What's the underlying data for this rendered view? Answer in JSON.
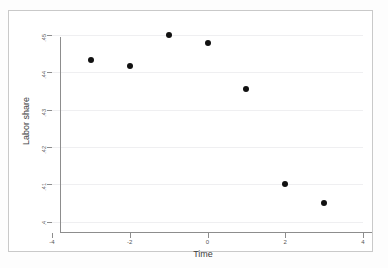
{
  "chart_data": {
    "type": "scatter",
    "title": "",
    "xlabel": "Time",
    "ylabel": "Labor share",
    "xlim": [
      -4,
      4
    ],
    "ylim": [
      0.4,
      0.45
    ],
    "grid": true,
    "legend": "none",
    "x_ticks": [
      {
        "value": -4,
        "label": "-4"
      },
      {
        "value": -2,
        "label": "-2"
      },
      {
        "value": 0,
        "label": "0"
      },
      {
        "value": 2,
        "label": "2"
      },
      {
        "value": 4,
        "label": "4"
      }
    ],
    "y_ticks": [
      {
        "value": 0.45,
        "label": ".45"
      },
      {
        "value": 0.44,
        "label": ".44"
      },
      {
        "value": 0.43,
        "label": ".43"
      },
      {
        "value": 0.42,
        "label": ".42"
      },
      {
        "value": 0.41,
        "label": ".41"
      },
      {
        "value": 0.4,
        "label": ".4"
      }
    ],
    "x": [
      -3,
      -2,
      -1,
      0,
      1,
      2,
      3
    ],
    "y": [
      0.4432,
      0.4418,
      0.4501,
      0.4478,
      0.4355,
      0.4102,
      0.4049
    ],
    "series": [
      {
        "name": "Labor share",
        "marker": "filled-circle",
        "color": "#111111",
        "points": [
          {
            "x": -3,
            "y": 0.4432
          },
          {
            "x": -2,
            "y": 0.4418
          },
          {
            "x": -1,
            "y": 0.4501
          },
          {
            "x": 0,
            "y": 0.4478
          },
          {
            "x": 1,
            "y": 0.4355
          },
          {
            "x": 2,
            "y": 0.4102
          },
          {
            "x": 3,
            "y": 0.4049
          }
        ]
      }
    ]
  },
  "colors": {
    "marker": "#111111",
    "gridline": "#efeff1",
    "axis": "#8d8d8d",
    "frame": "#c9c9c9",
    "text": "#3c3c3c"
  }
}
